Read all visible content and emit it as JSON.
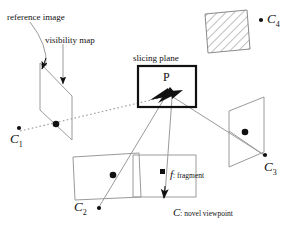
{
  "figure": {
    "type": "diagram",
    "title": "",
    "background_color": "#ffffff",
    "stroke_color": "#111111",
    "light_stroke_color": "#9a9a9a",
    "dotted_color": "#9a9a9a",
    "width": 295,
    "height": 229
  },
  "annotations": {
    "reference_image": "reference image",
    "visibility_map": "visibility map",
    "slicing_plane": "slicing plane",
    "point_p": "P",
    "fragment_marker": "f",
    "fragment_label": ": fragment",
    "novel_viewpoint_marker": "C",
    "novel_viewpoint_label": ": novel viewpoint"
  },
  "cameras": [
    {
      "id": "C1",
      "name": "C",
      "sub": "1",
      "x": 18,
      "y": 128,
      "label_x": 12,
      "label_y": 132
    },
    {
      "id": "C2",
      "name": "C",
      "sub": "2",
      "x": 100,
      "y": 209,
      "label_x": 74,
      "label_y": 203
    },
    {
      "id": "C3",
      "name": "C",
      "sub": "3",
      "x": 265,
      "y": 156,
      "label_x": 262,
      "label_y": 162
    },
    {
      "id": "C4",
      "name": "C",
      "sub": "4",
      "x": 259,
      "y": 19,
      "label_x": 263,
      "label_y": 12
    }
  ],
  "planes": [
    {
      "name": "reference-image-plane",
      "points": "40,63 72,96 72,140 40,110",
      "fill": "none",
      "stroke": "#9a9a9a"
    },
    {
      "name": "slicing-plane",
      "points": "138,66 196,66 196,107 138,107",
      "fill": "none",
      "stroke": "#111111"
    },
    {
      "name": "plane-c2",
      "points": "73,157 139,153 141,197 75,200",
      "fill": "none",
      "stroke": "#9a9a9a"
    },
    {
      "name": "plane-fragment",
      "points": "133,155 195,155 195,197 133,197",
      "fill": "none",
      "stroke": "#9a9a9a"
    },
    {
      "name": "plane-c3",
      "points": "229,111 264,97 264,152 229,167",
      "fill": "none",
      "stroke": "#9a9a9a"
    },
    {
      "name": "hatched-plane-c4",
      "points": "205,14 247,10 250,49 208,53",
      "fill": "hatch",
      "stroke": "#9a9a9a"
    }
  ],
  "dots": [
    {
      "name": "dot-reference-plane",
      "x": 56,
      "y": 124,
      "r": 3.2
    },
    {
      "name": "dot-plane-c2",
      "x": 113,
      "y": 175,
      "r": 3.2
    },
    {
      "name": "dot-plane-c3",
      "x": 245,
      "y": 132,
      "r": 3.2
    },
    {
      "name": "dot-fragment",
      "x": 163,
      "y": 172,
      "r": 2.4,
      "shape": "square"
    }
  ]
}
